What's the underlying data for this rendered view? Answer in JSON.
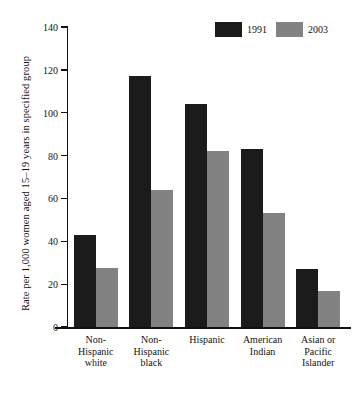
{
  "chart_data": {
    "type": "bar",
    "title": "",
    "xlabel": "",
    "ylabel": "Rate per 1,000 women aged 15–19 years in specified group",
    "ylim": [
      0,
      140
    ],
    "yticks": [
      0,
      20,
      40,
      60,
      80,
      100,
      120,
      140
    ],
    "ytick_labels": [
      "0",
      "20",
      "40",
      "60",
      "80",
      "100",
      "120",
      "140"
    ],
    "grid": false,
    "legend_position": "top-right",
    "categories": [
      "Non-Hispanic white",
      "Non-Hispanic black",
      "Hispanic",
      "American Indian",
      "Asian or Pacific Islander"
    ],
    "category_lines": [
      [
        "Non-",
        "Hispanic",
        "white"
      ],
      [
        "Non-",
        "Hispanic",
        "black"
      ],
      [
        "Hispanic"
      ],
      [
        "American",
        "Indian"
      ],
      [
        "Asian or",
        "Pacific",
        "Islander"
      ]
    ],
    "series": [
      {
        "name": "1991",
        "color": "#1b1b1b",
        "values": [
          43,
          117,
          104,
          83,
          27
        ]
      },
      {
        "name": "2003",
        "color": "#828282",
        "values": [
          27.5,
          64,
          82,
          53,
          17
        ]
      }
    ]
  },
  "legend": {
    "items": [
      {
        "label": "1991",
        "swatch": "dark"
      },
      {
        "label": "2003",
        "swatch": "gray"
      }
    ]
  },
  "colors": {
    "series_1991": "#1b1b1b",
    "series_2003": "#828282",
    "axis": "#111111",
    "background": "#ffffff"
  }
}
